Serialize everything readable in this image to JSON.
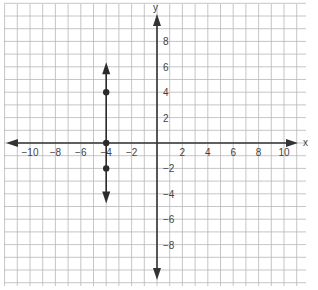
{
  "chart_data": {
    "type": "scatter",
    "title": "",
    "xlabel": "x",
    "ylabel": "y",
    "xlim": [
      -12,
      11
    ],
    "ylim": [
      -11,
      11
    ],
    "grid": true,
    "x_ticks": [
      -10,
      -8,
      -6,
      -4,
      -2,
      2,
      4,
      6,
      8,
      10
    ],
    "y_ticks": [
      8,
      6,
      4,
      2,
      -2,
      -4,
      -6,
      -8
    ],
    "x_tick_labels": [
      "−10",
      "−8",
      "−6",
      "−4",
      "−2",
      "2",
      "4",
      "6",
      "8",
      "10"
    ],
    "y_tick_labels": [
      "8",
      "6",
      "4",
      "2",
      "−2",
      "−4",
      "−6",
      "−8"
    ],
    "series": [
      {
        "name": "vertical line x = -4",
        "kind": "line",
        "x": [
          -4,
          -4
        ],
        "y": [
          6.2,
          -4.6
        ],
        "arrows": "both"
      },
      {
        "name": "points",
        "kind": "points",
        "points": [
          {
            "x": -4,
            "y": 4
          },
          {
            "x": -4,
            "y": 0
          },
          {
            "x": -4,
            "y": -2
          }
        ]
      }
    ]
  },
  "colors": {
    "grid": "#b8b8b8",
    "axis": "#333333",
    "ink": "#2b2b2b"
  }
}
